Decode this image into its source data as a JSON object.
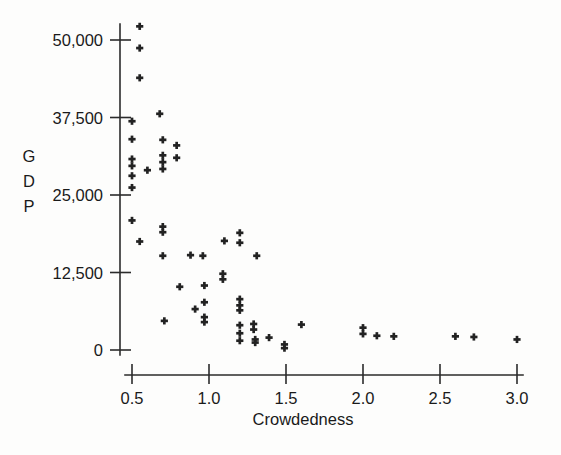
{
  "figure": {
    "background_color": "#fdfdfc",
    "ink_color": "#222222",
    "marker_symbol": "plus"
  },
  "chart_data": {
    "type": "scatter",
    "title": "",
    "subtitle": "",
    "xlabel": "Crowdedness",
    "ylabel": "GDP",
    "ylabel_chars": [
      "G",
      "D",
      "P"
    ],
    "xlim": [
      0.42,
      3.08
    ],
    "ylim": [
      -2500,
      54500
    ],
    "xticks": [
      0.5,
      1.0,
      1.5,
      2.0,
      2.5,
      3.0
    ],
    "xtick_labels": [
      "0.5",
      "1.0",
      "1.5",
      "2.0",
      "2.5",
      "3.0"
    ],
    "yticks": [
      0,
      12500,
      25000,
      37500,
      50000
    ],
    "ytick_labels": [
      "0",
      "12,500",
      "25,000",
      "37,500",
      "50,000"
    ],
    "grid": false,
    "legend": null,
    "marker": "+",
    "n_points": 62,
    "points": [
      {
        "x": 0.55,
        "y": 52200
      },
      {
        "x": 0.55,
        "y": 48700
      },
      {
        "x": 0.55,
        "y": 43900
      },
      {
        "x": 0.5,
        "y": 36900
      },
      {
        "x": 0.5,
        "y": 34000
      },
      {
        "x": 0.5,
        "y": 30800
      },
      {
        "x": 0.5,
        "y": 29700
      },
      {
        "x": 0.5,
        "y": 28100
      },
      {
        "x": 0.5,
        "y": 26200
      },
      {
        "x": 0.5,
        "y": 20900
      },
      {
        "x": 0.68,
        "y": 38100
      },
      {
        "x": 0.7,
        "y": 33900
      },
      {
        "x": 0.7,
        "y": 31400
      },
      {
        "x": 0.7,
        "y": 30300
      },
      {
        "x": 0.7,
        "y": 29200
      },
      {
        "x": 0.6,
        "y": 29000
      },
      {
        "x": 0.79,
        "y": 33000
      },
      {
        "x": 0.79,
        "y": 31000
      },
      {
        "x": 0.7,
        "y": 19900
      },
      {
        "x": 0.7,
        "y": 19000
      },
      {
        "x": 0.55,
        "y": 17500
      },
      {
        "x": 0.7,
        "y": 15200
      },
      {
        "x": 0.88,
        "y": 15300
      },
      {
        "x": 0.96,
        "y": 15200
      },
      {
        "x": 1.1,
        "y": 17600
      },
      {
        "x": 1.2,
        "y": 18900
      },
      {
        "x": 1.2,
        "y": 17300
      },
      {
        "x": 1.31,
        "y": 15200
      },
      {
        "x": 1.09,
        "y": 12300
      },
      {
        "x": 1.09,
        "y": 11400
      },
      {
        "x": 0.81,
        "y": 10200
      },
      {
        "x": 0.97,
        "y": 10400
      },
      {
        "x": 0.97,
        "y": 7700
      },
      {
        "x": 0.91,
        "y": 6600
      },
      {
        "x": 0.97,
        "y": 5300
      },
      {
        "x": 0.97,
        "y": 4500
      },
      {
        "x": 0.71,
        "y": 4700
      },
      {
        "x": 1.2,
        "y": 8200
      },
      {
        "x": 1.2,
        "y": 7200
      },
      {
        "x": 1.2,
        "y": 6400
      },
      {
        "x": 1.2,
        "y": 4000
      },
      {
        "x": 1.2,
        "y": 2700
      },
      {
        "x": 1.2,
        "y": 1500
      },
      {
        "x": 1.29,
        "y": 4200
      },
      {
        "x": 1.29,
        "y": 3300
      },
      {
        "x": 1.3,
        "y": 1700
      },
      {
        "x": 1.3,
        "y": 1200
      },
      {
        "x": 1.39,
        "y": 2000
      },
      {
        "x": 1.49,
        "y": 900
      },
      {
        "x": 1.49,
        "y": 300
      },
      {
        "x": 1.6,
        "y": 4100
      },
      {
        "x": 2.0,
        "y": 3600
      },
      {
        "x": 2.0,
        "y": 2600
      },
      {
        "x": 2.09,
        "y": 2300
      },
      {
        "x": 2.2,
        "y": 2200
      },
      {
        "x": 2.6,
        "y": 2200
      },
      {
        "x": 2.72,
        "y": 2100
      },
      {
        "x": 3.0,
        "y": 1700
      }
    ]
  }
}
